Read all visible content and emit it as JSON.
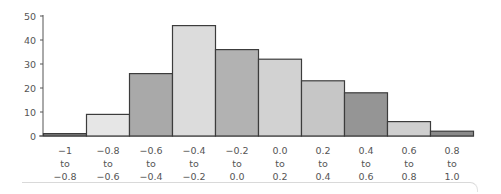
{
  "chart_data": {
    "type": "bar",
    "title": "",
    "xlabel": "",
    "ylabel": "",
    "ylim": [
      0,
      50
    ],
    "yticks": [
      0,
      10,
      20,
      30,
      40,
      50
    ],
    "grid": false,
    "legend": null,
    "categories": [
      [
        "−1",
        "to",
        "−0.8"
      ],
      [
        "−0.8",
        "to",
        "−0.6"
      ],
      [
        "−0.6",
        "to",
        "−0.4"
      ],
      [
        "−0.4",
        "to",
        "−0.2"
      ],
      [
        "−0.2",
        "to",
        "0.0"
      ],
      [
        "0.0",
        "to",
        "0.2"
      ],
      [
        "0.2",
        "to",
        "0.4"
      ],
      [
        "0.4",
        "to",
        "0.6"
      ],
      [
        "0.6",
        "to",
        "0.8"
      ],
      [
        "0.8",
        "to",
        "1.0"
      ]
    ],
    "values": [
      1,
      9,
      26,
      46,
      36,
      32,
      23,
      18,
      6,
      2
    ],
    "bar_colors": [
      "#7d7d7d",
      "#e6e6e6",
      "#a9a9a9",
      "#dcdcdc",
      "#b2b2b2",
      "#d2d2d2",
      "#c6c6c6",
      "#959595",
      "#cfcfcf",
      "#8a8a8a"
    ]
  },
  "axis": {
    "color": "#555555",
    "bar_stroke": "#3c3c3c"
  }
}
